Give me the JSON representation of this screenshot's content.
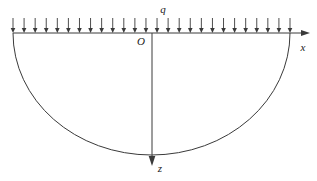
{
  "figure": {
    "background_color": "#ffffff",
    "line_color": "#3a3a3a",
    "text_color": "#1a1a1a",
    "width": 317,
    "height": 181
  },
  "labels": {
    "load": "q",
    "origin": "O",
    "x_axis": "x",
    "z_axis": "z"
  },
  "chart_data": {
    "type": "diagram",
    "elements": [
      {
        "name": "ground-surface-axis",
        "kind": "axis",
        "label": "x",
        "direction": "horizontal-right",
        "from": [
          13,
          33
        ],
        "to": [
          310,
          33
        ],
        "arrowhead": "right"
      },
      {
        "name": "depth-axis",
        "kind": "axis",
        "label": "z",
        "direction": "vertical-down",
        "from": [
          152,
          33
        ],
        "to": [
          152,
          165
        ],
        "arrowhead": "down"
      },
      {
        "name": "distributed-load",
        "kind": "load",
        "label": "q",
        "distribution": "uniform",
        "arrow_count": 26,
        "span_x": [
          13,
          290
        ],
        "arrow_top_y": 18,
        "arrow_tip_y": 33,
        "direction": "down"
      },
      {
        "name": "influence-boundary-arc",
        "kind": "arc",
        "shape": "semicircle",
        "left_end": [
          13,
          33
        ],
        "right_end": [
          290,
          33
        ],
        "bottom": [
          152,
          155
        ]
      },
      {
        "name": "origin-point",
        "kind": "point",
        "label": "O",
        "position": [
          152,
          33
        ]
      }
    ],
    "axis_labels": {
      "horizontal": "x",
      "vertical": "z"
    },
    "annotations": [
      "q",
      "O",
      "x",
      "z"
    ],
    "grid": false,
    "legend": false
  },
  "geometry": {
    "surface_y": 33,
    "load_left_x": 13,
    "load_right_x": 290,
    "arrow_top_y": 18,
    "arrow_count": 26,
    "axis_x_end": 310,
    "z_axis_x": 152,
    "z_axis_end_y": 165,
    "arc_bottom_y": 155
  },
  "label_positions": {
    "load": [
      163,
      13
    ],
    "origin": [
      141,
      45
    ],
    "x_axis": [
      303,
      51
    ],
    "z_axis": [
      160,
      170
    ]
  }
}
